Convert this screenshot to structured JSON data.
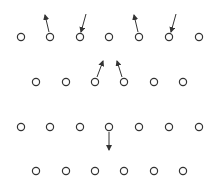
{
  "diagram": {
    "colors": {
      "stroke": "#333333",
      "background": "#ffffff"
    },
    "circle_radius": 3.6,
    "rows": [
      {
        "y": 37,
        "xs": [
          21,
          50,
          80,
          109,
          139,
          169,
          199
        ]
      },
      {
        "y": 82,
        "xs": [
          36,
          66,
          95,
          124,
          154,
          183
        ]
      },
      {
        "y": 127,
        "xs": [
          21,
          50,
          80,
          109,
          139,
          169,
          199
        ]
      },
      {
        "y": 171,
        "xs": [
          36,
          66,
          95,
          124,
          154,
          183
        ]
      }
    ],
    "arrows": [
      {
        "x1": 49,
        "y1": 32,
        "x2": 45,
        "y2": 15
      },
      {
        "x1": 86,
        "y1": 14,
        "x2": 81,
        "y2": 32
      },
      {
        "x1": 138,
        "y1": 32,
        "x2": 134,
        "y2": 15
      },
      {
        "x1": 176,
        "y1": 14,
        "x2": 171,
        "y2": 32
      },
      {
        "x1": 97,
        "y1": 77,
        "x2": 103,
        "y2": 61
      },
      {
        "x1": 122,
        "y1": 77,
        "x2": 117,
        "y2": 61
      },
      {
        "x1": 109,
        "y1": 132,
        "x2": 109,
        "y2": 150
      }
    ]
  }
}
